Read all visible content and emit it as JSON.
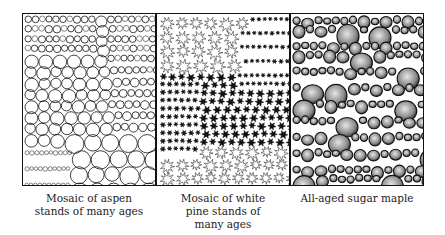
{
  "figure": {
    "panels": [
      {
        "id": "aspen",
        "caption_lines": [
          "Mosaic of aspen",
          "stands of many ages"
        ],
        "pattern": "open-circles-mosaic"
      },
      {
        "id": "white-pine",
        "caption_lines": [
          "Mosaic of white",
          "pine stands of",
          "many ages"
        ],
        "pattern": "star-crowns-mosaic"
      },
      {
        "id": "sugar-maple",
        "caption_lines": [
          "All-aged sugar maple"
        ],
        "pattern": "shaded-blobs-all-aged"
      }
    ]
  },
  "colors": {
    "ink": "#111111",
    "paper": "#ffffff",
    "shade": "#8a8a8a"
  }
}
